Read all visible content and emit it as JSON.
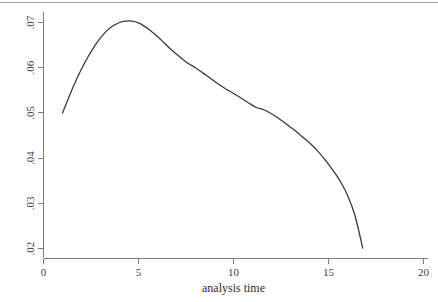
{
  "figure": {
    "background_color": "#ffffff",
    "curve_color": "#3a3a3a",
    "axis_color": "#7d7d7d",
    "width": 438,
    "height": 302
  },
  "chart_data": {
    "type": "line",
    "title": "",
    "subtitle": "",
    "xlabel": "analysis time",
    "ylabel": "",
    "xlim": [
      0,
      20
    ],
    "ylim": [
      0.02,
      0.07
    ],
    "grid": false,
    "legend": null,
    "legend_position": "none",
    "x_ticks": [
      0,
      5,
      10,
      15,
      20
    ],
    "x_tick_labels": [
      "0",
      "5",
      "10",
      "15",
      "20"
    ],
    "y_ticks": [
      0.02,
      0.03,
      0.04,
      0.05,
      0.06,
      0.07
    ],
    "y_tick_labels": [
      ".02",
      ".03",
      ".04",
      ".05",
      ".06",
      ".07"
    ],
    "y_tick_labels_rotated": true,
    "series": [
      {
        "name": "smoothed hazard",
        "x": [
          1.0,
          1.3,
          1.6,
          2.0,
          2.4,
          2.8,
          3.2,
          3.6,
          4.0,
          4.3,
          4.7,
          5.0,
          5.3,
          5.6,
          6.0,
          6.4,
          6.8,
          7.2,
          7.6,
          8.0,
          8.4,
          8.8,
          9.2,
          9.6,
          10.0,
          10.4,
          10.8,
          11.2,
          11.6,
          12.0,
          12.4,
          12.8,
          13.2,
          13.6,
          14.0,
          14.4,
          14.8,
          15.2,
          15.6,
          16.0,
          16.4,
          16.8
        ],
        "y": [
          0.05,
          0.0531,
          0.0561,
          0.0597,
          0.0628,
          0.0655,
          0.0676,
          0.0691,
          0.07,
          0.0703,
          0.0703,
          0.0699,
          0.0692,
          0.0683,
          0.0669,
          0.0653,
          0.0637,
          0.0623,
          0.061,
          0.06,
          0.0588,
          0.0576,
          0.0564,
          0.0553,
          0.0543,
          0.0533,
          0.0522,
          0.0512,
          0.0507,
          0.0498,
          0.0487,
          0.0475,
          0.0462,
          0.0448,
          0.0434,
          0.0417,
          0.0397,
          0.0375,
          0.035,
          0.0318,
          0.0272,
          0.0201
        ]
      }
    ],
    "annotations": []
  }
}
